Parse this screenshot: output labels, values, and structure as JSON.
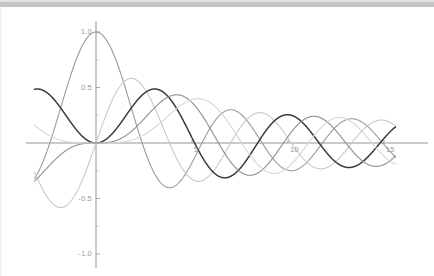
{
  "figure": {
    "background_color": "#ffffff",
    "top_band_color": "#b8b8b8",
    "axis_color": "#8a8a8a",
    "tick_label_color": "#9a9a9a"
  },
  "chart_data": {
    "type": "line",
    "title": "",
    "subtitle": "",
    "xlabel": "",
    "ylabel": "",
    "xlim": [
      -3.2,
      15.6
    ],
    "ylim": [
      -1.06,
      1.06
    ],
    "grid": false,
    "legend": "none",
    "x_ticks": [
      {
        "value": 5,
        "label": "5"
      },
      {
        "value": 10,
        "label": "10"
      },
      {
        "value": 15,
        "label": "15"
      }
    ],
    "y_ticks": [
      {
        "value": 1.0,
        "label": "1.0"
      },
      {
        "value": 0.5,
        "label": "0.5"
      },
      {
        "value": -0.5,
        "label": "-0.5"
      },
      {
        "value": -1.0,
        "label": "-1.0"
      }
    ],
    "minor_y_ticks": [
      0.75,
      0.25,
      -0.25,
      -0.75
    ],
    "series": [
      {
        "name": "J0",
        "color": "#9b9b9b",
        "width": 1.1,
        "order": 0
      },
      {
        "name": "J1",
        "color": "#c9c9c9",
        "width": 1.1,
        "order": 1
      },
      {
        "name": "J2",
        "color": "#3a3a3a",
        "width": 1.5,
        "order": 2
      },
      {
        "name": "J3",
        "color": "#8e8e8e",
        "width": 1.1,
        "order": 3
      },
      {
        "name": "J4",
        "color": "#d6d6d6",
        "width": 1.1,
        "order": 4
      }
    ]
  }
}
